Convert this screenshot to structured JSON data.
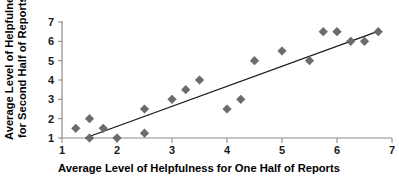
{
  "chart_data": {
    "type": "scatter",
    "title": "",
    "xlabel": "Average Level of Helpfulness for One Half of Reports",
    "ylabel": "Average Level of Helpfulness for Second Half of Reports",
    "ylabel_line1": "Average Level of Helpfulness",
    "ylabel_line2": "for Second Half of Reports",
    "xlim": [
      1,
      7
    ],
    "ylim": [
      1,
      7
    ],
    "xticks": [
      1,
      2,
      3,
      4,
      5,
      6,
      7
    ],
    "yticks": [
      1,
      2,
      3,
      4,
      5,
      6,
      7
    ],
    "xtick_labels": [
      "1",
      "2",
      "3",
      "4",
      "5",
      "6",
      "7"
    ],
    "ytick_labels": [
      "1",
      "2",
      "3",
      "4",
      "5",
      "6",
      "7"
    ],
    "grid": false,
    "legend": null,
    "marker_shape": "diamond",
    "marker_color": "#6b6b6b",
    "points": [
      {
        "x": 1.25,
        "y": 1.5
      },
      {
        "x": 1.5,
        "y": 2.0
      },
      {
        "x": 1.5,
        "y": 1.0
      },
      {
        "x": 1.75,
        "y": 1.5
      },
      {
        "x": 2.0,
        "y": 1.0
      },
      {
        "x": 2.5,
        "y": 2.5
      },
      {
        "x": 2.5,
        "y": 1.25
      },
      {
        "x": 3.0,
        "y": 3.0
      },
      {
        "x": 3.25,
        "y": 3.5
      },
      {
        "x": 3.5,
        "y": 4.0
      },
      {
        "x": 4.0,
        "y": 2.5
      },
      {
        "x": 4.25,
        "y": 3.0
      },
      {
        "x": 4.5,
        "y": 5.0
      },
      {
        "x": 5.0,
        "y": 5.5
      },
      {
        "x": 5.5,
        "y": 5.0
      },
      {
        "x": 5.75,
        "y": 6.5
      },
      {
        "x": 6.0,
        "y": 6.5
      },
      {
        "x": 6.25,
        "y": 6.0
      },
      {
        "x": 6.5,
        "y": 6.0
      },
      {
        "x": 6.75,
        "y": 6.5
      }
    ],
    "trendline": {
      "type": "linear-fit",
      "x_start": 1.42,
      "y_start": 1.0,
      "x_end": 6.78,
      "y_end": 6.55
    }
  }
}
